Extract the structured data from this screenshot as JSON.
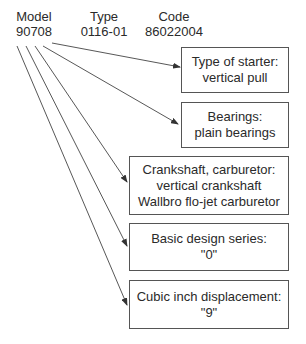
{
  "header": {
    "model": {
      "label": "Model",
      "value": "90708"
    },
    "type": {
      "label": "Type",
      "value": "0116-01"
    },
    "code": {
      "label": "Code",
      "value": "86022004"
    }
  },
  "boxes": [
    {
      "title": "Type of starter:",
      "lines": [
        "vertical pull"
      ]
    },
    {
      "title": "Bearings:",
      "lines": [
        "plain bearings"
      ]
    },
    {
      "title": "Crankshaft, carburetor:",
      "lines": [
        "vertical crankshaft",
        "Wallbro flo-jet carburetor"
      ]
    },
    {
      "title": "Basic design series:",
      "lines": [
        "\"0\""
      ]
    },
    {
      "title": "Cubic inch displacement:",
      "lines": [
        "\"9\""
      ]
    }
  ],
  "colors": {
    "line": "#444444",
    "border": "#555555",
    "text": "#2a2a2a"
  }
}
